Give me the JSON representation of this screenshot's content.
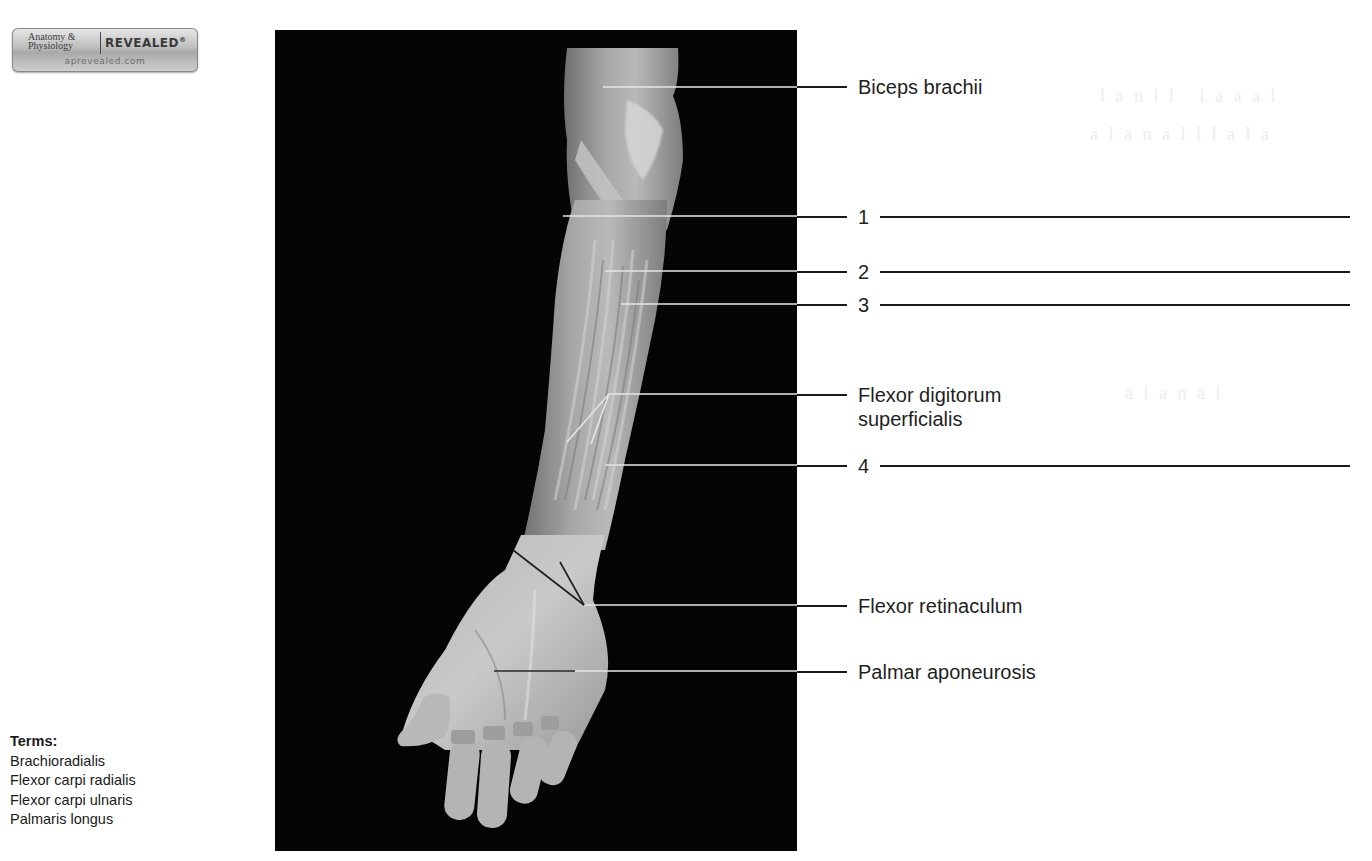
{
  "logo": {
    "left_line1": "Anatomy &",
    "left_line2": "Physiology",
    "right": "REVEALED",
    "registered": "®",
    "url": "aprevealed.com"
  },
  "terms": {
    "title": "Terms:",
    "items": [
      "Brachioradialis",
      "Flexor carpi radialis",
      "Flexor carpi ulnaris",
      "Palmaris longus"
    ]
  },
  "figure": {
    "background_color": "#050505",
    "labels": [
      {
        "id": "biceps",
        "text": "Biceps brachii",
        "type": "named"
      },
      {
        "id": "blank1",
        "text": "1",
        "type": "numbered"
      },
      {
        "id": "blank2",
        "text": "2",
        "type": "numbered"
      },
      {
        "id": "blank3",
        "text": "3",
        "type": "numbered"
      },
      {
        "id": "fds",
        "text_line1": "Flexor digitorum",
        "text_line2": "superficialis",
        "type": "named"
      },
      {
        "id": "blank4",
        "text": "4",
        "type": "numbered"
      },
      {
        "id": "retinaculum",
        "text": "Flexor retinaculum",
        "type": "named"
      },
      {
        "id": "palmar",
        "text": "Palmar aponeurosis",
        "type": "named"
      }
    ]
  },
  "colors": {
    "text": "#1f1f1f",
    "leader_on_photo": "#e6e6e6",
    "leader_on_page": "#1a1a1a",
    "bleedthrough": "#ececec"
  }
}
